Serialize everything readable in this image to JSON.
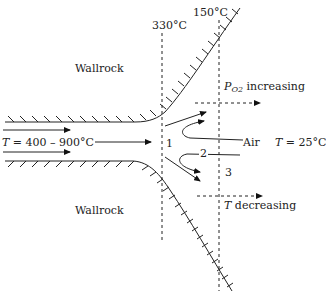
{
  "diagram": {
    "labels": {
      "wallrock_top": "Wallrock",
      "wallrock_bottom": "Wallrock",
      "temp_330": "330°C",
      "temp_150": "150°C",
      "inflow_T_var": "T",
      "inflow_T_value": " = 400 – 900°C",
      "po2_P": "P",
      "po2_sub": "O2",
      "po2_text": " increasing",
      "air": "Air",
      "ambient_T_var": "T",
      "ambient_T_value": " = 25°C",
      "t_dec_var": "T",
      "t_dec_text": " decreasing",
      "zone_1": "1",
      "zone_2": "2",
      "zone_3": "3"
    }
  }
}
